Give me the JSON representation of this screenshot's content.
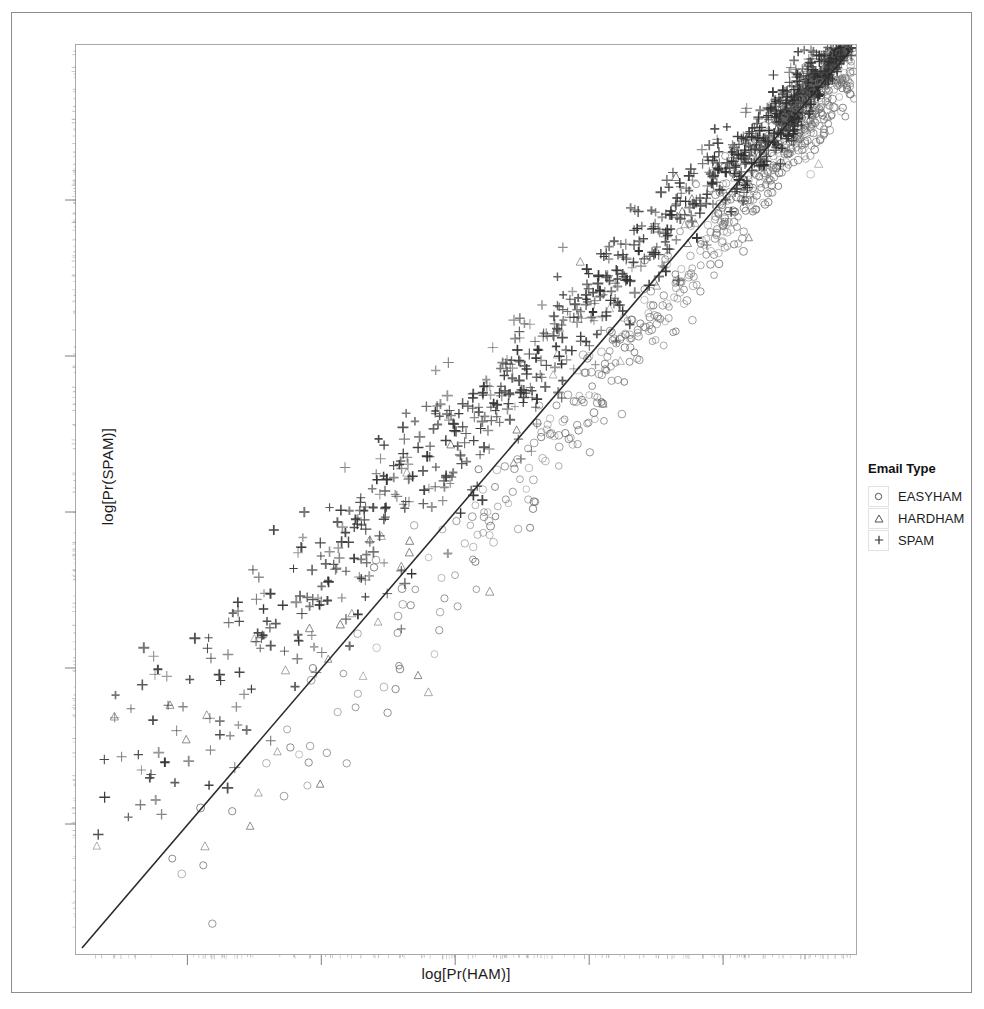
{
  "figure": {
    "x_axis_label": "log[Pr(HAM)]",
    "y_axis_label": "log[Pr(SPAM)]"
  },
  "legend": {
    "title": "Email Type",
    "entries": [
      {
        "label": "EASYHAM",
        "marker": "circle-icon",
        "color": "#555555"
      },
      {
        "label": "HARDHAM",
        "marker": "triangle-icon",
        "color": "#555555"
      },
      {
        "label": "SPAM",
        "marker": "plus-icon",
        "color": "#333333"
      }
    ]
  },
  "chart_data": {
    "type": "scatter",
    "title": "",
    "xlabel": "log[Pr(HAM)]",
    "ylabel": "log[Pr(SPAM)]",
    "xlim": [
      -1600,
      0
    ],
    "ylim": [
      -1600,
      0
    ],
    "grid": false,
    "legend_position": "right",
    "axis_tick_labels": {
      "x": [],
      "y": []
    },
    "x_major_ticks": [
      -1370,
      -1096,
      -822,
      -548,
      -274
    ],
    "y_major_ticks": [
      -1370,
      -1096,
      -822,
      -548,
      -274
    ],
    "annotations": [
      {
        "type": "reference-line",
        "label": "y = x",
        "from": [
          -1600,
          -1600
        ],
        "to": [
          0,
          0
        ],
        "color": "#2b2b2b"
      }
    ],
    "series": [
      {
        "name": "EASYHAM",
        "marker": "circle",
        "color": "#6b6b6b",
        "n_points": 520,
        "region": "below and along the y=x diagonal, concentrated in the upper-right dense cluster",
        "points": [
          [
            -120,
            -140
          ],
          [
            -150,
            -180
          ],
          [
            -180,
            -210
          ],
          [
            -200,
            -240
          ],
          [
            -230,
            -265
          ],
          [
            -250,
            -300
          ],
          [
            -270,
            -320
          ],
          [
            -300,
            -350
          ],
          [
            -320,
            -380
          ],
          [
            -350,
            -400
          ],
          [
            -380,
            -430
          ],
          [
            -400,
            -465
          ],
          [
            -430,
            -490
          ],
          [
            -450,
            -520
          ],
          [
            -480,
            -545
          ],
          [
            -500,
            -575
          ],
          [
            -530,
            -600
          ],
          [
            -550,
            -630
          ],
          [
            -580,
            -660
          ],
          [
            -600,
            -690
          ],
          [
            -630,
            -715
          ],
          [
            -650,
            -745
          ],
          [
            -680,
            -770
          ],
          [
            -700,
            -800
          ],
          [
            -730,
            -830
          ],
          [
            -760,
            -860
          ],
          [
            -790,
            -890
          ],
          [
            -820,
            -915
          ],
          [
            -850,
            -945
          ],
          [
            -880,
            -975
          ],
          [
            -900,
            -1000
          ],
          [
            -930,
            -1030
          ],
          [
            -960,
            -1060
          ],
          [
            -990,
            -1090
          ],
          [
            -1020,
            -1120
          ],
          [
            -1050,
            -1150
          ],
          [
            -1080,
            -1180
          ],
          [
            -1110,
            -1210
          ],
          [
            -1140,
            -1240
          ],
          [
            -1170,
            -1270
          ],
          [
            -1200,
            -1300
          ],
          [
            -1230,
            -1330
          ],
          [
            -1260,
            -1360
          ],
          [
            -1290,
            -1390
          ],
          [
            -1320,
            -1420
          ],
          [
            -1350,
            -1450
          ],
          [
            -140,
            -260
          ],
          [
            -180,
            -320
          ],
          [
            -220,
            -390
          ],
          [
            -260,
            -450
          ],
          [
            -300,
            -520
          ],
          [
            -340,
            -580
          ],
          [
            -380,
            -650
          ],
          [
            -420,
            -710
          ],
          [
            -460,
            -780
          ],
          [
            -500,
            -840
          ],
          [
            -540,
            -910
          ],
          [
            -580,
            -970
          ],
          [
            -620,
            -1040
          ],
          [
            -660,
            -1100
          ],
          [
            -700,
            -1170
          ],
          [
            -740,
            -1230
          ],
          [
            -100,
            -110
          ],
          [
            -110,
            -125
          ],
          [
            -130,
            -150
          ],
          [
            -160,
            -175
          ],
          [
            -190,
            -205
          ],
          [
            -210,
            -235
          ],
          [
            -240,
            -270
          ],
          [
            -280,
            -305
          ]
        ]
      },
      {
        "name": "HARDHAM",
        "marker": "triangle",
        "color": "#6b6b6b",
        "n_points": 65,
        "region": "scattered broadly, mostly mid-left and along the diagonal",
        "points": [
          [
            -560,
            -600
          ],
          [
            -640,
            -700
          ],
          [
            -720,
            -760
          ],
          [
            -800,
            -840
          ],
          [
            -880,
            -920
          ],
          [
            -960,
            -1000
          ],
          [
            -1040,
            -1080
          ],
          [
            -1120,
            -1160
          ],
          [
            -500,
            -420
          ],
          [
            -620,
            -540
          ],
          [
            -740,
            -620
          ],
          [
            -860,
            -720
          ],
          [
            -980,
            -820
          ],
          [
            -1100,
            -900
          ],
          [
            -1220,
            -1020
          ],
          [
            -1300,
            -1120
          ],
          [
            -420,
            -340
          ],
          [
            -540,
            -440
          ],
          [
            -660,
            -520
          ],
          [
            -780,
            -600
          ],
          [
            -900,
            -700
          ],
          [
            -1020,
            -780
          ],
          [
            -1140,
            -880
          ],
          [
            -1260,
            -960
          ],
          [
            -350,
            -300
          ],
          [
            -470,
            -380
          ],
          [
            -590,
            -460
          ],
          [
            -710,
            -540
          ],
          [
            -830,
            -620
          ],
          [
            -950,
            -700
          ],
          [
            -1070,
            -780
          ],
          [
            -1190,
            -860
          ]
        ]
      },
      {
        "name": "SPAM",
        "marker": "plus",
        "color": "#333333",
        "n_points": 760,
        "region": "above the y=x diagonal, spread from lower-left to the dense upper-right cluster",
        "points": [
          [
            -1400,
            -900
          ],
          [
            -1350,
            -860
          ],
          [
            -1300,
            -820
          ],
          [
            -1250,
            -780
          ],
          [
            -1200,
            -740
          ],
          [
            -1150,
            -700
          ],
          [
            -1100,
            -660
          ],
          [
            -1050,
            -620
          ],
          [
            -1000,
            -580
          ],
          [
            -950,
            -540
          ],
          [
            -900,
            -500
          ],
          [
            -850,
            -460
          ],
          [
            -800,
            -420
          ],
          [
            -750,
            -380
          ],
          [
            -700,
            -340
          ],
          [
            -650,
            -300
          ],
          [
            -600,
            -270
          ],
          [
            -550,
            -240
          ],
          [
            -500,
            -210
          ],
          [
            -450,
            -185
          ],
          [
            -400,
            -160
          ],
          [
            -350,
            -140
          ],
          [
            -300,
            -120
          ],
          [
            -250,
            -100
          ],
          [
            -200,
            -85
          ],
          [
            -160,
            -70
          ],
          [
            -120,
            -55
          ],
          [
            -90,
            -45
          ],
          [
            -1450,
            -1000
          ],
          [
            -1380,
            -940
          ],
          [
            -1310,
            -880
          ],
          [
            -1240,
            -830
          ],
          [
            -1170,
            -780
          ],
          [
            -1100,
            -730
          ],
          [
            -1030,
            -680
          ],
          [
            -960,
            -630
          ],
          [
            -890,
            -580
          ],
          [
            -820,
            -530
          ],
          [
            -750,
            -480
          ],
          [
            -680,
            -430
          ],
          [
            -610,
            -390
          ],
          [
            -540,
            -350
          ],
          [
            -470,
            -310
          ],
          [
            -400,
            -275
          ],
          [
            -330,
            -240
          ],
          [
            -260,
            -200
          ],
          [
            -190,
            -160
          ],
          [
            -130,
            -120
          ],
          [
            -80,
            -80
          ]
        ]
      }
    ]
  }
}
